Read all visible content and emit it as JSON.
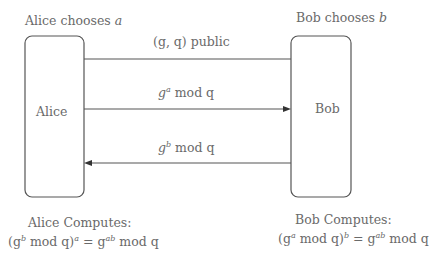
{
  "diagram": {
    "parties": {
      "alice": {
        "header_prefix": "Alice chooses ",
        "header_var": "a",
        "box_label": "Alice",
        "computes_label": "Alice Computes:",
        "formula": {
          "open": "(g",
          "inner_exp": "b",
          "mid": " mod q)",
          "outer_exp": "a",
          "eq": " = g",
          "result_exp": "ab",
          "tail": " mod q"
        }
      },
      "bob": {
        "header_prefix": "Bob chooses ",
        "header_var": "b",
        "box_label": "Bob",
        "computes_label": "Bob Computes:",
        "formula": {
          "open": "(g",
          "inner_exp": "a",
          "mid": " mod q)",
          "outer_exp": "b",
          "eq": " = g",
          "result_exp": "ab",
          "tail": " mod q"
        }
      }
    },
    "messages": [
      {
        "label": "(g, q) public",
        "direction": "none"
      },
      {
        "base": "g",
        "exp": "a",
        "tail": " mod q",
        "direction": "alice-to-bob"
      },
      {
        "base": "g",
        "exp": "b",
        "tail": " mod q",
        "direction": "bob-to-alice"
      }
    ],
    "colors": {
      "stroke": "#555555",
      "text": "#6a6a6a",
      "background": "#ffffff"
    }
  }
}
